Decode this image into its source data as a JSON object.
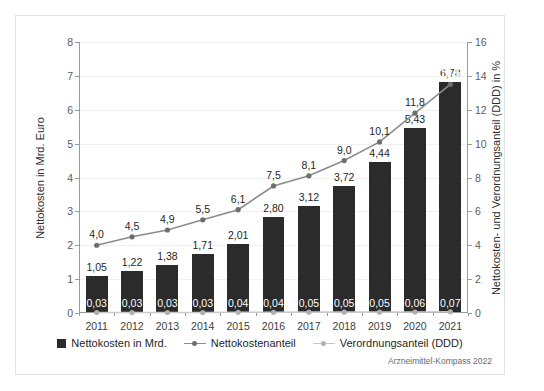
{
  "source_note": "Arzneimittel-Kompass 2022",
  "axes": {
    "left": {
      "title": "Nettokosten in Mrd. Euro",
      "ticks": [
        "0",
        "1",
        "2",
        "3",
        "4",
        "5",
        "6",
        "7",
        "8"
      ]
    },
    "right": {
      "title": "Nettokosten- und Verordnungsanteil (DDD) in %",
      "ticks": [
        "0",
        "2",
        "4",
        "6",
        "8",
        "10",
        "12",
        "14",
        "16"
      ]
    }
  },
  "legend": {
    "items": [
      {
        "label": "Nettokosten in Mrd.",
        "marker": "square-swatch",
        "color": "#2b2b2b"
      },
      {
        "label": "Nettokostenanteil",
        "marker": "line-marker",
        "color": "#8c8c8c"
      },
      {
        "label": "Verordnungsanteil (DDD)",
        "marker": "line-marker",
        "color": "#c9c9c9"
      }
    ]
  },
  "chart_data": {
    "type": "bar",
    "title": "",
    "xlabel": "",
    "ylabel": "Nettokosten in Mrd. Euro",
    "y2label": "Nettokosten- und Verordnungsanteil (DDD) in %",
    "ylim": [
      0,
      8
    ],
    "y2lim": [
      0,
      16
    ],
    "grid": true,
    "legend_position": "bottom",
    "categories": [
      "2011",
      "2012",
      "2013",
      "2014",
      "2015",
      "2016",
      "2017",
      "2018",
      "2019",
      "2020",
      "2021"
    ],
    "series": [
      {
        "name": "Nettokosten in Mrd.",
        "type": "bar",
        "axis": "left",
        "color": "#2b2b2b",
        "values": [
          1.05,
          1.22,
          1.38,
          1.71,
          2.01,
          2.8,
          3.12,
          3.72,
          4.44,
          5.43,
          6.78
        ],
        "labels": [
          "1,05",
          "1,22",
          "1,38",
          "1,71",
          "2,01",
          "2,80",
          "3,12",
          "3,72",
          "4,44",
          "5,43",
          "6,78"
        ]
      },
      {
        "name": "Nettokostenanteil",
        "type": "line",
        "axis": "right",
        "color": "#8c8c8c",
        "values": [
          4.0,
          4.5,
          4.9,
          5.5,
          6.1,
          7.5,
          8.1,
          9.0,
          10.1,
          11.8,
          13.5
        ],
        "labels": [
          "4,0",
          "4,5",
          "4,9",
          "5,5",
          "6,1",
          "7,5",
          "8,1",
          "9,0",
          "10,1",
          "11,8",
          "13,5"
        ]
      },
      {
        "name": "Verordnungsanteil (DDD)",
        "type": "line",
        "axis": "right",
        "color": "#c9c9c9",
        "values": [
          0.03,
          0.03,
          0.03,
          0.03,
          0.04,
          0.04,
          0.05,
          0.05,
          0.05,
          0.06,
          0.07
        ],
        "labels": [
          "0,03",
          "0,03",
          "0,03",
          "0,03",
          "0,04",
          "0,04",
          "0,05",
          "0,05",
          "0,05",
          "0,06",
          "0,07"
        ]
      }
    ]
  }
}
